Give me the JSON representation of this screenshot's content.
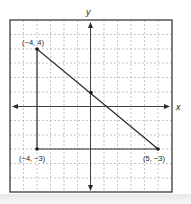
{
  "figure": {
    "type": "coordinate-plane-triangle",
    "axis_labels": {
      "x": "x",
      "y": "y"
    },
    "grid": {
      "x_range": [
        -6,
        6
      ],
      "y_range": [
        -6,
        6
      ],
      "style": "dashed"
    },
    "vertices": [
      {
        "label": "(−4, 4)",
        "x": -4,
        "y": 4
      },
      {
        "label": "(−4, −3)",
        "x": -4,
        "y": -3
      },
      {
        "label": "(5, −3)",
        "x": 5,
        "y": -3
      }
    ],
    "midpoint": {
      "x": 0.5,
      "y": 0.5
    },
    "colors": {
      "line": "#2b2b2b",
      "grid": "#9a9a9a",
      "frame": "#3a3a3a"
    }
  }
}
